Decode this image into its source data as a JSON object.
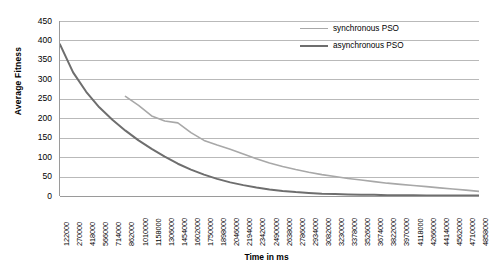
{
  "chart_data": {
    "type": "line",
    "title": "",
    "xlabel": "Time in ms",
    "ylabel": "Average Fitness",
    "ylim": [
      0,
      450
    ],
    "yticks": [
      0,
      50,
      100,
      150,
      200,
      250,
      300,
      350,
      400,
      450
    ],
    "grid": true,
    "legend_position": "top-right",
    "categories": [
      "122000",
      "270000",
      "418000",
      "566000",
      "714000",
      "862000",
      "1010000",
      "1158000",
      "1306000",
      "1454000",
      "1602000",
      "1750000",
      "1898000",
      "2046000",
      "2194000",
      "2342000",
      "2490000",
      "2638000",
      "2786000",
      "2934000",
      "3082000",
      "3230000",
      "3378000",
      "3526000",
      "3674000",
      "3822000",
      "3970000",
      "4118000",
      "4266000",
      "4414000",
      "4562000",
      "4710000",
      "4858000"
    ],
    "series": [
      {
        "name": "synchronous PSO",
        "color": "#a8a8a8",
        "width": 1.6,
        "values": [
          null,
          null,
          null,
          null,
          null,
          256,
          233,
          206,
          193,
          188,
          163,
          143,
          131,
          120,
          108,
          96,
          85,
          76,
          68,
          61,
          55,
          50,
          45,
          41,
          37,
          33,
          30,
          27,
          24,
          21,
          18,
          15,
          12
        ]
      },
      {
        "name": "asynchronous PSO",
        "color": "#6e6e6e",
        "width": 2.0,
        "values": [
          390,
          318,
          268,
          228,
          196,
          168,
          143,
          121,
          101,
          83,
          68,
          55,
          44,
          35,
          28,
          22,
          17,
          13,
          10,
          8,
          6,
          5,
          4,
          3,
          3,
          2,
          2,
          2,
          1,
          1,
          1,
          1,
          1
        ]
      }
    ]
  },
  "legend": {
    "items": [
      {
        "label": "synchronous PSO",
        "color": "#a8a8a8",
        "thickness": "1.6px"
      },
      {
        "label": "asynchronous PSO",
        "color": "#6e6e6e",
        "thickness": "2.4px"
      }
    ]
  },
  "axes": {
    "y_title": "Average Fitness",
    "x_title": "Time in ms"
  }
}
